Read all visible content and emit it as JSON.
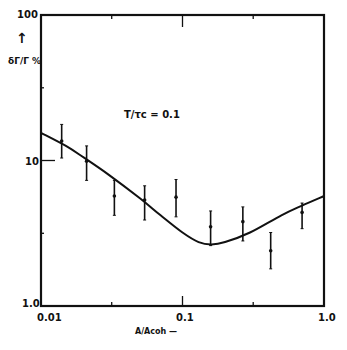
{
  "chart_data": {
    "type": "scatter",
    "title": "",
    "annotation": "T/τc = 0.1",
    "xlabel": "A/Acoh →",
    "ylabel": "δΓ/Γ %",
    "xscale": "log",
    "yscale": "log",
    "xlim": [
      0.01,
      1.0
    ],
    "ylim": [
      1.0,
      100
    ],
    "x_ticks": [
      "0.01",
      "0.1",
      "1.0"
    ],
    "y_ticks": [
      "1.0",
      "10",
      "100"
    ],
    "grid": false,
    "series": [
      {
        "name": "measured",
        "type": "scatter_errorbar",
        "x": [
          0.014,
          0.021,
          0.033,
          0.054,
          0.09,
          0.158,
          0.267,
          0.42,
          0.7
        ],
        "y": [
          13.6,
          9.9,
          5.7,
          5.35,
          5.6,
          3.5,
          3.8,
          2.4,
          4.4
        ],
        "y_err_low": [
          10.4,
          7.3,
          4.2,
          3.9,
          4.1,
          2.6,
          2.8,
          1.8,
          3.4
        ],
        "y_err_high": [
          17.7,
          12.6,
          7.3,
          6.7,
          7.4,
          4.5,
          4.8,
          3.2,
          5.1
        ]
      },
      {
        "name": "theory",
        "type": "line",
        "x": [
          0.01,
          0.015,
          0.02,
          0.03,
          0.05,
          0.07,
          0.1,
          0.13,
          0.16,
          0.2,
          0.3,
          0.5,
          0.7,
          1.0
        ],
        "y": [
          15.5,
          12.6,
          10.5,
          8.0,
          5.5,
          4.2,
          3.2,
          2.75,
          2.65,
          2.75,
          3.2,
          4.2,
          4.9,
          5.7
        ]
      }
    ]
  },
  "labels": {
    "y_top": "100",
    "y_mid": "10",
    "y_bottom": "1.0",
    "x_left": "0.01",
    "x_mid": "0.1",
    "x_right": "1.0",
    "ylabel_arrow": "↑",
    "ylabel": "δΓ/Γ %",
    "xlabel": "A/Acoh —",
    "annotation": "T/τc   = 0.1"
  }
}
